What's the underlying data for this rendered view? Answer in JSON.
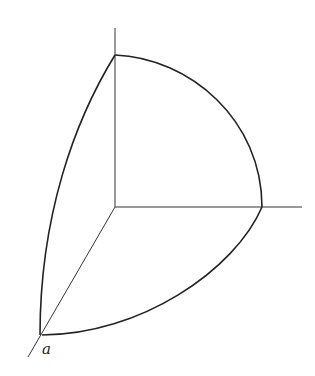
{
  "diagram": {
    "type": "spherical-octant",
    "labels": {
      "point_a": "a"
    },
    "colors": {
      "stroke": "#222222",
      "background": "#ffffff"
    }
  }
}
